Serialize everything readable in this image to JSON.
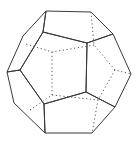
{
  "figure": {
    "colors": {
      "front_face": "#a9a9a9",
      "side_faces": "#d4d4d4",
      "top_face": "#e4e4e4",
      "bottom_faces": "#e8e8e8",
      "edge": "#3a3a3a",
      "hidden_edge": "#555555",
      "background": "#ffffff"
    }
  }
}
